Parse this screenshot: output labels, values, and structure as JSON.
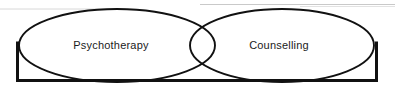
{
  "diagram": {
    "type": "venn",
    "background_color": "#ffffff",
    "stroke_color": "#111111",
    "text_color": "#1b1b1b",
    "frame": {
      "name": "enclosing-rectangle",
      "visible_edges": [
        "left",
        "bottom",
        "right"
      ],
      "x": 16,
      "y": 43,
      "width": 362,
      "height": 39,
      "stroke_width": 3
    },
    "sets": [
      {
        "id": "psychotherapy",
        "label": "Psychotherapy",
        "cx": 117,
        "cy": 45.5,
        "rx": 98,
        "ry": 36.5,
        "label_x": 111,
        "label_y": 46
      },
      {
        "id": "counselling",
        "label": "Counselling",
        "cx": 282,
        "cy": 45.5,
        "rx": 92,
        "ry": 36.5,
        "label_x": 279,
        "label_y": 46
      }
    ],
    "overlap": {
      "name": "intersection-lens",
      "x_start": 190,
      "x_end": 215,
      "label": ""
    }
  }
}
